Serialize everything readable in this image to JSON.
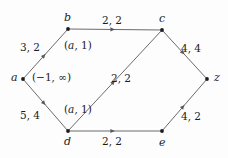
{
  "figure": {
    "type": "directed-graph",
    "background_color": "#fdfdfd",
    "stroke_color": "#6b6b6b",
    "node_color": "#1c1c1c",
    "text_color": "#1c1c1c"
  },
  "nodes": [
    {
      "id": "a",
      "label": "a",
      "x": 23,
      "y": 79,
      "label_x": 11,
      "label_y": 72
    },
    {
      "id": "b",
      "label": "b",
      "x": 68,
      "y": 29,
      "label_x": 64,
      "label_y": 12
    },
    {
      "id": "c",
      "label": "c",
      "x": 162,
      "y": 30,
      "label_x": 159,
      "label_y": 13
    },
    {
      "id": "d",
      "label": "d",
      "x": 68,
      "y": 131,
      "label_x": 64,
      "label_y": 136
    },
    {
      "id": "e",
      "label": "e",
      "x": 162,
      "y": 131,
      "label_x": 159,
      "label_y": 137
    },
    {
      "id": "z",
      "label": "z",
      "x": 207,
      "y": 79,
      "label_x": 214,
      "label_y": 72
    }
  ],
  "edges": [
    {
      "from": "a",
      "to": "b",
      "label": "3, 2",
      "label_x": 20,
      "label_y": 42,
      "italic": false
    },
    {
      "from": "b",
      "to": "c",
      "label": "2, 2",
      "label_x": 102,
      "label_y": 15,
      "italic": false
    },
    {
      "from": "c",
      "to": "z",
      "label": "4, 4",
      "label_x": 181,
      "label_y": 43,
      "italic": false
    },
    {
      "from": "a",
      "to": "d",
      "label": "5, 4",
      "label_x": 20,
      "label_y": 110,
      "italic": false
    },
    {
      "from": "d",
      "to": "c",
      "label": "2, 2",
      "label_x": 111,
      "label_y": 73,
      "italic": false
    },
    {
      "from": "d",
      "to": "e",
      "label": "2, 2",
      "label_x": 102,
      "label_y": 136,
      "italic": false
    },
    {
      "from": "e",
      "to": "z",
      "label": "4, 2",
      "label_x": 181,
      "label_y": 111,
      "italic": false
    }
  ],
  "annotations": [
    {
      "name": "ab-interval-label",
      "text": "(a, 1)",
      "x": 64,
      "y": 40,
      "italic": true
    },
    {
      "name": "a-potential-label",
      "text": "(−1, ∞)",
      "x": 32,
      "y": 72,
      "italic": false
    },
    {
      "name": "ad-interval-label",
      "text": "(a, 1)",
      "x": 64,
      "y": 104,
      "italic": true
    }
  ]
}
